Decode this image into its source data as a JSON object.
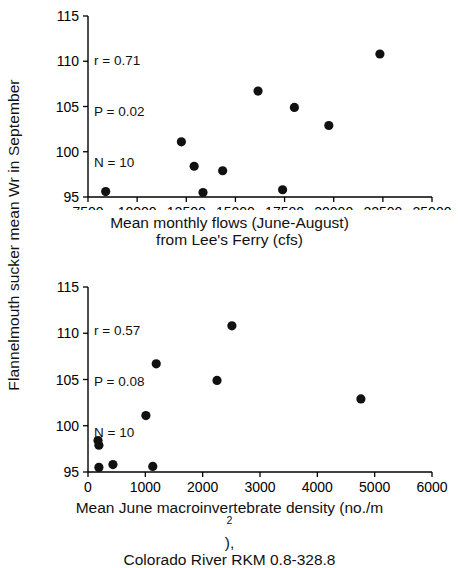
{
  "figure": {
    "y_axis_label": "Flannelmouth sucker mean Wr in September",
    "background": "#ffffff",
    "point_color": "#111111"
  },
  "chart_data": [
    {
      "id": "top",
      "type": "scatter",
      "title": "",
      "xlabel_line1": "Mean monthly flows (June-August)",
      "xlabel_line2": "from Lee's Ferry (cfs)",
      "ylabel": "Flannelmouth sucker mean Wr in September",
      "xlim": [
        7500,
        25000
      ],
      "ylim": [
        95,
        115
      ],
      "xticks": [
        7500,
        10000,
        12500,
        15000,
        17500,
        20000,
        22500,
        25000
      ],
      "xtick_labels": [
        "7500",
        "10000",
        "12500",
        "15000",
        "17500",
        "20000",
        "22500",
        "25000"
      ],
      "yticks": [
        95,
        100,
        105,
        110,
        115
      ],
      "ytick_labels": [
        "95",
        "100",
        "105",
        "110",
        "115"
      ],
      "grid": false,
      "legend": "none",
      "annotations": {
        "r_label": "r = 0.71",
        "p_label": "P = 0.02",
        "n_label": "N = 10"
      },
      "x": [
        8400,
        12250,
        12900,
        13350,
        14350,
        16150,
        17400,
        18000,
        19750,
        22350
      ],
      "y": [
        95.6,
        101.1,
        98.4,
        95.5,
        97.9,
        106.7,
        95.8,
        104.9,
        102.9,
        110.8
      ]
    },
    {
      "id": "bottom",
      "type": "scatter",
      "title": "",
      "xlabel_line1": "Mean June macroinvertebrate density (no./m2),",
      "xlabel_line1_pre": "Mean June macroinvertebrate density (no./m",
      "xlabel_line1_sup": "2",
      "xlabel_line1_post": "),",
      "xlabel_line2": "Colorado River RKM 0.8-328.8",
      "ylabel": "Flannelmouth sucker mean Wr in September",
      "xlim": [
        0,
        6000
      ],
      "ylim": [
        95,
        115
      ],
      "xticks": [
        0,
        1000,
        2000,
        3000,
        4000,
        5000,
        6000
      ],
      "xtick_labels": [
        "0",
        "1000",
        "2000",
        "3000",
        "4000",
        "5000",
        "6000"
      ],
      "yticks": [
        95,
        100,
        105,
        110,
        115
      ],
      "ytick_labels": [
        "95",
        "100",
        "105",
        "110",
        "115"
      ],
      "grid": false,
      "legend": "none",
      "annotations": {
        "r_label": "r = 0.57",
        "p_label": "P = 0.08",
        "n_label": "N = 10"
      },
      "x": [
        175,
        190,
        190,
        435,
        1010,
        1130,
        1190,
        2250,
        2510,
        4760
      ],
      "y": [
        98.4,
        97.9,
        95.5,
        95.8,
        101.1,
        95.6,
        106.7,
        104.9,
        110.8,
        102.9
      ]
    }
  ]
}
